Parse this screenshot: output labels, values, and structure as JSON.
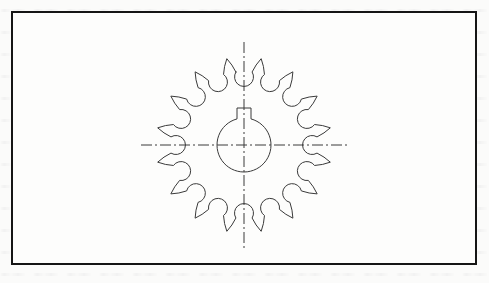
{
  "document": {
    "kind": "engineering-drawing",
    "view": "front-view",
    "subject": "sprocket-wheel"
  },
  "frame": {
    "x": 11,
    "y": 11,
    "width": 466,
    "height": 254,
    "border_color": "#151515",
    "border_width": 2,
    "fill_color": "#fdfdfc"
  },
  "paper": {
    "background_color": "#fbfbfa",
    "bleed_through_visible": true
  },
  "sprocket": {
    "center_x": 244,
    "center_y": 145,
    "tooth_count": 16,
    "tip_radius": 88,
    "root_radius": 78,
    "valley_radius": 9.5,
    "line_color": "#3a3a3a",
    "line_width": 1,
    "fill": "none"
  },
  "bore": {
    "radius": 27,
    "center_x": 244,
    "center_y": 145,
    "line_color": "#3a3a3a",
    "line_width": 1
  },
  "keyway": {
    "half_width": 7,
    "top_y": 108,
    "line_color": "#3a3a3a",
    "line_width": 1
  },
  "centerlines": {
    "style": "dash-dot",
    "color": "#3a3a3a",
    "line_width": 1,
    "dash_pattern": "11 3 2 3",
    "horizontal": {
      "x1": 141,
      "y1": 145,
      "x2": 347,
      "y2": 145
    },
    "vertical": {
      "x1": 244,
      "y1": 42,
      "x2": 244,
      "y2": 248
    }
  }
}
